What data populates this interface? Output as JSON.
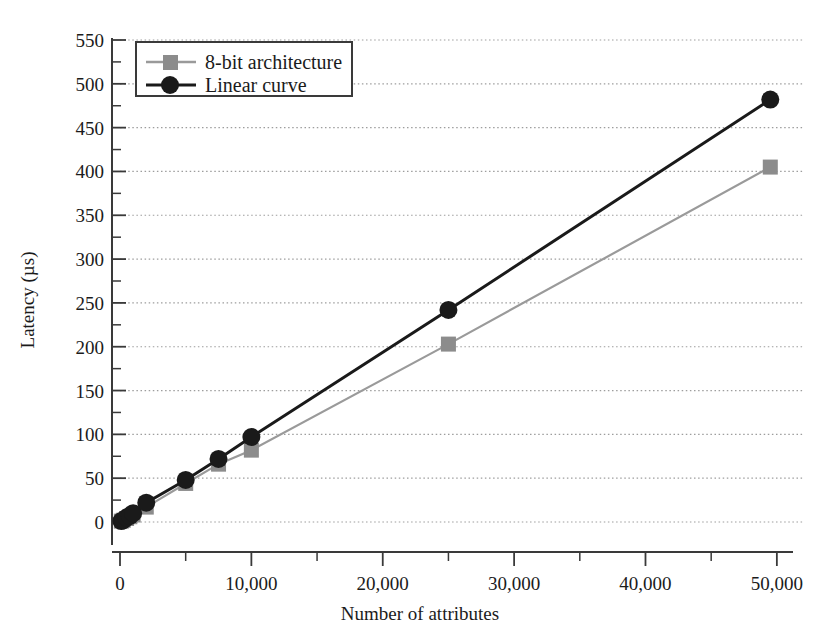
{
  "chart_data": {
    "type": "line",
    "title": "",
    "xlabel": "Number of attributes",
    "ylabel": "Latency (µs)",
    "xlim": [
      0,
      53000
    ],
    "ylim": [
      -15,
      560
    ],
    "grid": "horizontal-dotted",
    "legend_position": "top-left-inside",
    "x_ticks": [
      0,
      10000,
      20000,
      30000,
      40000,
      50000
    ],
    "x_tick_labels": [
      "0",
      "10,000",
      "20,000",
      "30,000",
      "40,000",
      "50,000"
    ],
    "x_minor_interval": 5000,
    "y_ticks": [
      0,
      50,
      100,
      150,
      200,
      250,
      300,
      350,
      400,
      450,
      500,
      550
    ],
    "y_tick_labels": [
      "0",
      "50",
      "100",
      "150",
      "200",
      "250",
      "300",
      "350",
      "400",
      "450",
      "500",
      "550"
    ],
    "y_minor_interval": 25,
    "series": [
      {
        "name": "8-bit architecture",
        "marker": "square",
        "color": "#8c8c8c",
        "line_color": "#9a9a9a",
        "x": [
          100,
          250,
          500,
          750,
          1000,
          2000,
          5000,
          7500,
          10000,
          25000,
          49500
        ],
        "y": [
          1,
          2,
          4,
          6,
          8,
          17,
          44,
          66,
          82,
          203,
          405
        ]
      },
      {
        "name": "Linear curve",
        "marker": "circle",
        "color": "#1a1a1a",
        "line_color": "#1a1a1a",
        "x": [
          100,
          250,
          500,
          750,
          1000,
          2000,
          5000,
          7500,
          10000,
          25000,
          49500
        ],
        "y": [
          1,
          2,
          5,
          7,
          10,
          22,
          48,
          72,
          97,
          242,
          482
        ]
      }
    ]
  },
  "legend": {
    "entries": [
      {
        "label": "8-bit architecture",
        "marker": "square",
        "color": "#8c8c8c"
      },
      {
        "label": "Linear curve",
        "marker": "circle",
        "color": "#1a1a1a"
      }
    ]
  },
  "axes": {
    "x_title": "Number of attributes",
    "y_title": "Latency (µs)",
    "x_tick_labels": [
      "0",
      "10,000",
      "20,000",
      "30,000",
      "40,000",
      "50,000"
    ],
    "y_tick_labels": [
      "0",
      "50",
      "100",
      "150",
      "200",
      "250",
      "300",
      "350",
      "400",
      "450",
      "500",
      "550"
    ]
  },
  "colors": {
    "series_gray": "#8c8c8c",
    "series_black": "#1a1a1a",
    "axis": "#3a3a3a",
    "grid": "#9d9d9d",
    "background": "#ffffff"
  }
}
